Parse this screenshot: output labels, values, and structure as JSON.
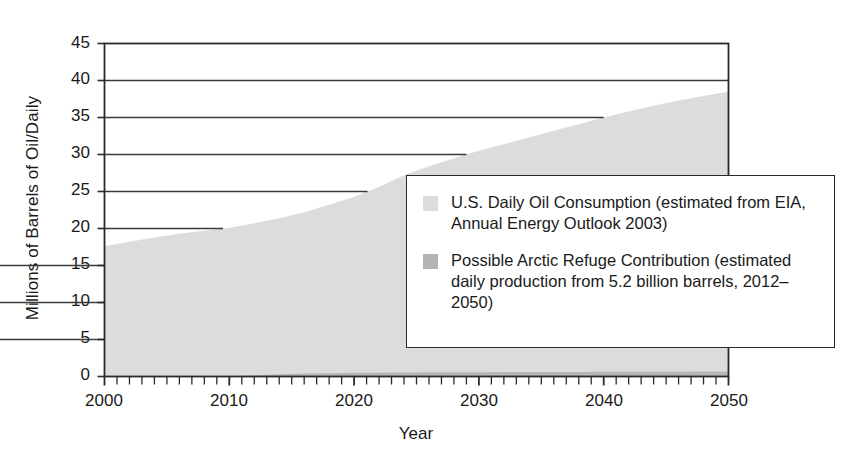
{
  "chart_data": {
    "type": "area",
    "title": "",
    "subtitle": "",
    "xlabel": "Year",
    "ylabel": "Millions of Barrels of Oil/Daily",
    "xlim": [
      2000,
      2050
    ],
    "ylim": [
      0,
      45
    ],
    "grid": true,
    "grid_axis": "y",
    "legend_position": "inside-right",
    "x_ticks": [
      2000,
      2010,
      2020,
      2030,
      2040,
      2050
    ],
    "x_tick_labels": [
      "2000",
      "2010",
      "2020",
      "2030",
      "2040",
      "2050"
    ],
    "x_minor_tick_interval": 1,
    "y_ticks": [
      0,
      5,
      10,
      15,
      20,
      25,
      30,
      35,
      40,
      45
    ],
    "y_tick_labels": [
      "0",
      "5",
      "10",
      "15",
      "20",
      "25",
      "30",
      "35",
      "40",
      "45"
    ],
    "x": [
      2000,
      2002,
      2004,
      2006,
      2008,
      2010,
      2012,
      2014,
      2016,
      2018,
      2020,
      2022,
      2024,
      2026,
      2028,
      2030,
      2032,
      2034,
      2036,
      2038,
      2040,
      2042,
      2044,
      2046,
      2048,
      2050
    ],
    "series": [
      {
        "name": "U.S. Daily Oil Consumption (estimated from EIA, Annual Energy Outlook 2003)",
        "color": "#dcdcdc",
        "values": [
          17.6,
          18.2,
          18.8,
          19.3,
          19.7,
          20.1,
          20.7,
          21.4,
          22.2,
          23.2,
          24.3,
          25.6,
          27.2,
          28.4,
          29.5,
          30.5,
          31.4,
          32.3,
          33.2,
          34.1,
          35.0,
          35.8,
          36.6,
          37.3,
          37.9,
          38.5
        ]
      },
      {
        "name": "Possible Arctic Refuge Contribution (estimated daily production from 5.2 billion barrels, 2012-2050)",
        "color": "#b3b3b3",
        "values": [
          0,
          0,
          0,
          0,
          0,
          0,
          0.15,
          0.3,
          0.4,
          0.45,
          0.5,
          0.52,
          0.55,
          0.56,
          0.57,
          0.58,
          0.6,
          0.6,
          0.62,
          0.62,
          0.63,
          0.64,
          0.65,
          0.65,
          0.66,
          0.66
        ]
      }
    ],
    "annotations": []
  },
  "legend": {
    "entries": [
      {
        "swatch_color": "#dcdcdc",
        "label": "U.S. Daily Oil Consumption (estimated from EIA, Annual Energy Outlook 2003)"
      },
      {
        "swatch_color": "#b3b3b3",
        "label": "Possible Arctic Refuge Contribution (estimated daily production from 5.2 billion barrels, 2012–2050)"
      }
    ]
  },
  "axes": {
    "y_title": "Millions of Barrels of Oil/Daily",
    "x_title": "Year",
    "y_labels": [
      "45",
      "40",
      "35",
      "30",
      "25",
      "20",
      "15",
      "10",
      "5",
      "0"
    ],
    "x_labels": [
      "2000",
      "2010",
      "2020",
      "2030",
      "2040",
      "2050"
    ]
  },
  "colors": {
    "consumption_fill": "#dcdcdc",
    "arctic_fill": "#b3b3b3",
    "axis_line": "#2a2a2a",
    "grid_line": "#3a3a3a",
    "background": "#ffffff"
  }
}
